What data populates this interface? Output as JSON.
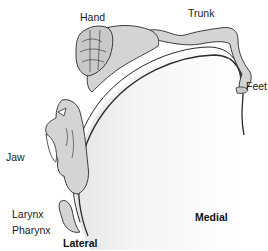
{
  "diagram": {
    "type": "motor-homunculus",
    "labels": {
      "hand": "Hand",
      "trunk": "Trunk",
      "feet": "Feet",
      "jaw": "Jaw",
      "larynx": "Larynx",
      "pharynx": "Pharynx",
      "lateral": "Lateral",
      "medial": "Medial"
    },
    "colors": {
      "body_fill": "#d4d4d4",
      "outline": "#2a2a2a",
      "cortex_shade": "#ececec",
      "background": "#ffffff"
    }
  }
}
